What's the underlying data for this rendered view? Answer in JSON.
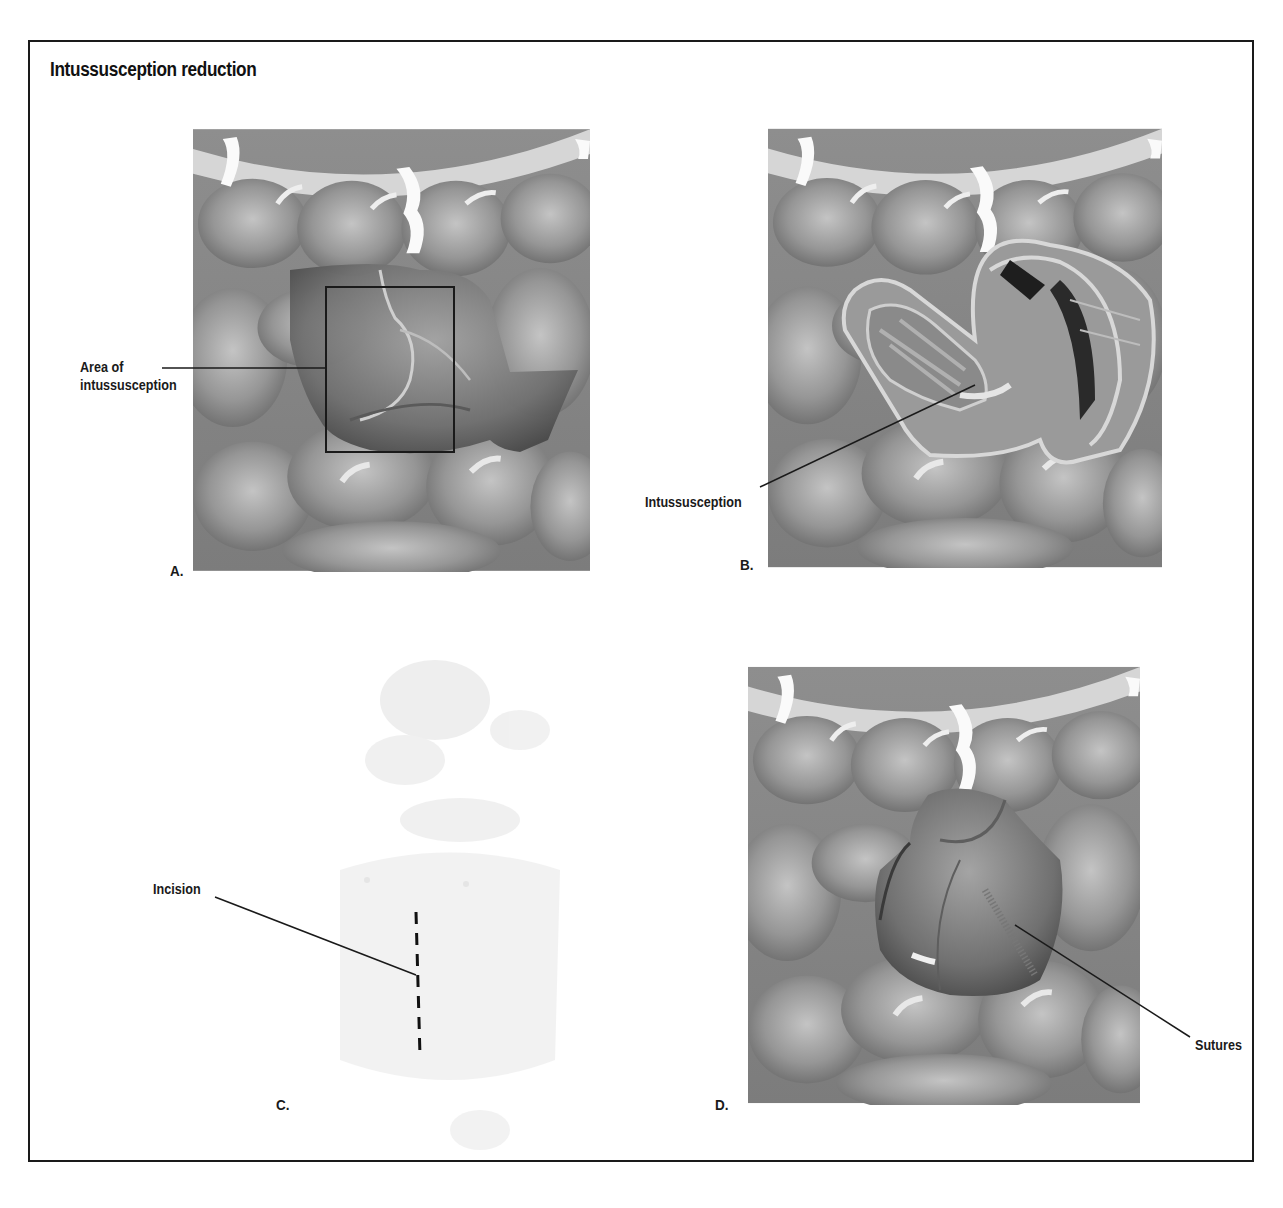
{
  "figure": {
    "title": "Intussusception reduction",
    "frame_color": "#1a1a1a",
    "background": "#ffffff"
  },
  "panels": [
    {
      "id": "A",
      "letter": "A.",
      "description": "Intestines with boxed area of intussusception",
      "callouts": [
        {
          "line1": "Area of",
          "line2": "intussusception"
        }
      ]
    },
    {
      "id": "B",
      "letter": "B.",
      "description": "Cutaway view showing telescoped bowel",
      "callouts": [
        {
          "text": "Intussusception"
        }
      ]
    },
    {
      "id": "C",
      "letter": "C.",
      "description": "Faint torso outline with dashed incision line",
      "callouts": [
        {
          "text": "Incision"
        }
      ]
    },
    {
      "id": "D",
      "letter": "D.",
      "description": "Reduced bowel segment with suture line",
      "callouts": [
        {
          "text": "Sutures"
        }
      ]
    }
  ],
  "colors": {
    "bowel_base": "#8a8a8a",
    "bowel_light": "#b8b8b8",
    "bowel_dark": "#5a5a5a",
    "highlight": "#e6e6e6",
    "leader_line": "#1a1a1a"
  }
}
